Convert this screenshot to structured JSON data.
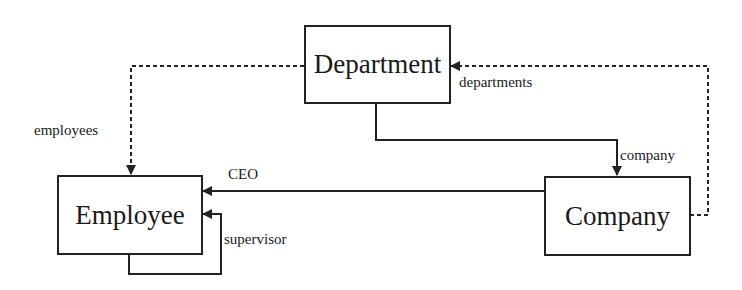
{
  "diagram": {
    "entities": [
      {
        "id": "department",
        "label": "Department"
      },
      {
        "id": "employee",
        "label": "Employee"
      },
      {
        "id": "company",
        "label": "Company"
      }
    ],
    "relations": [
      {
        "id": "employees",
        "label": "employees",
        "from": "Department",
        "to": "Employee",
        "style": "dotted"
      },
      {
        "id": "departments",
        "label": "departments",
        "from": "Company",
        "to": "Department",
        "style": "dotted"
      },
      {
        "id": "company",
        "label": "company",
        "from": "Department",
        "to": "Company",
        "style": "solid"
      },
      {
        "id": "ceo",
        "label": "CEO",
        "from": "Company",
        "to": "Employee",
        "style": "solid"
      },
      {
        "id": "supervisor",
        "label": "supervisor",
        "from": "Employee",
        "to": "Employee",
        "style": "solid"
      }
    ],
    "colors": {
      "line": "#222222",
      "background": "#ffffff"
    }
  }
}
